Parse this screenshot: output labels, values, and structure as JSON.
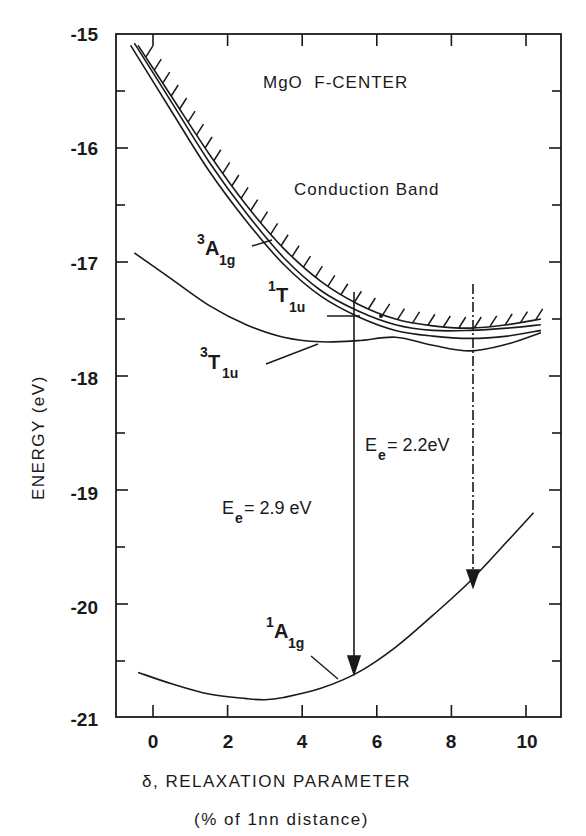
{
  "chart_data": {
    "type": "line",
    "title": "MgO  F-CENTER",
    "annotations": {
      "band_label": "Conduction Band",
      "transition_1": {
        "prefix": "E",
        "sub": "e",
        "text": "= 2.9 eV",
        "x": 5.4,
        "from": -17.7,
        "to": -20.62
      },
      "transition_2": {
        "prefix": "E",
        "sub": "e",
        "text": "= 2.2eV",
        "x": 8.6,
        "from": -17.6,
        "to": -19.83
      }
    },
    "xlabel": "δ, RELAXATION PARAMETER",
    "xlabel_sub": "(% of 1nn distance)",
    "ylabel": "ENERGY (eV)",
    "xlim": [
      -0.75,
      11.2
    ],
    "ylim": [
      -21,
      -15
    ],
    "x_ticks": [
      0,
      2,
      4,
      6,
      8,
      10
    ],
    "x_tick_labels": [
      "0",
      "2",
      "4",
      "6",
      "8",
      "10"
    ],
    "y_ticks": [
      -15,
      -16,
      -17,
      -18,
      -19,
      -20,
      -21
    ],
    "y_tick_labels": [
      "-15",
      "-16",
      "-17",
      "-18",
      "-19",
      "-20",
      "-21"
    ],
    "grid": false,
    "legend": "none (inline curve labels)",
    "series": [
      {
        "name": "Conduction Band edge",
        "label": "Conduction Band",
        "style": "hatched",
        "x": [
          -0.4,
          0.5,
          1.5,
          2.5,
          3.5,
          4.5,
          5.5,
          6.5,
          7.5,
          8.5,
          9.5,
          10.4
        ],
        "y": [
          -15.1,
          -15.55,
          -16.05,
          -16.5,
          -16.88,
          -17.17,
          -17.37,
          -17.5,
          -17.56,
          -17.58,
          -17.55,
          -17.5
        ]
      },
      {
        "name": "3A1g",
        "label": "3A1g",
        "x": [
          -0.5,
          0.5,
          1.5,
          2.5,
          3.5,
          4.5,
          5.5,
          6.5,
          7.5,
          8.5,
          9.5,
          10.4
        ],
        "y": [
          -15.08,
          -15.6,
          -16.12,
          -16.57,
          -16.96,
          -17.25,
          -17.43,
          -17.55,
          -17.6,
          -17.6,
          -17.58,
          -17.55
        ]
      },
      {
        "name": "1T1u",
        "label": "1T1u",
        "x": [
          -0.6,
          0.5,
          1.5,
          2.5,
          3.5,
          4.5,
          5.5,
          6.5,
          7.5,
          8.5,
          9.5,
          10.4
        ],
        "y": [
          -15.1,
          -15.68,
          -16.2,
          -16.64,
          -17.02,
          -17.3,
          -17.48,
          -17.6,
          -17.65,
          -17.67,
          -17.65,
          -17.6
        ]
      },
      {
        "name": "3T1u",
        "label": "3T1u",
        "x": [
          -0.5,
          0.5,
          1.5,
          2.5,
          3.5,
          4.5,
          5.5,
          6.5,
          7.5,
          8.5,
          9.5,
          10.4
        ],
        "y": [
          -16.92,
          -17.15,
          -17.38,
          -17.55,
          -17.66,
          -17.7,
          -17.69,
          -17.66,
          -17.73,
          -17.78,
          -17.72,
          -17.62
        ]
      },
      {
        "name": "1A1g",
        "label": "1A1g",
        "x": [
          -0.4,
          0.5,
          1.5,
          2.5,
          3.0,
          3.5,
          4.5,
          5.5,
          6.5,
          7.5,
          8.5,
          9.5,
          10.2
        ],
        "y": [
          -20.6,
          -20.7,
          -20.79,
          -20.83,
          -20.84,
          -20.82,
          -20.74,
          -20.6,
          -20.38,
          -20.1,
          -19.8,
          -19.45,
          -19.2
        ]
      }
    ],
    "curve_labels": [
      {
        "sup": "3",
        "main": "A",
        "sub": "1g",
        "for": "3A1g"
      },
      {
        "sup": "1",
        "main": "T",
        "sub": "1u",
        "for": "1T1u"
      },
      {
        "sup": "3",
        "main": "T",
        "sub": "1u",
        "for": "3T1u"
      },
      {
        "sup": "1",
        "main": "A",
        "sub": "1g",
        "for": "1A1g"
      }
    ]
  },
  "text": {
    "title": "MgO  F-CENTER",
    "band_label": "Conduction Band",
    "xlabel": "δ, RELAXATION PARAMETER",
    "xlabel_sub": "(% of 1nn distance)",
    "ylabel": "ENERGY (eV)",
    "e_prefix": "E",
    "e_sub": "e",
    "transition_1": "= 2.9 eV",
    "transition_2": "= 2.2eV",
    "labels": {
      "a3_sup": "3",
      "a3_main": "A",
      "a3_sub": "1g",
      "t1_sup": "1",
      "t1_main": "T",
      "t1_sub": "1u",
      "t3_sup": "3",
      "t3_main": "T",
      "t3_sub": "1u",
      "a1_sup": "1",
      "a1_main": "A",
      "a1_sub": "1g"
    },
    "x_ticks": [
      "0",
      "2",
      "4",
      "6",
      "8",
      "10"
    ],
    "y_ticks": [
      "-15",
      "-16",
      "-17",
      "-18",
      "-19",
      "-20",
      "-21"
    ]
  }
}
